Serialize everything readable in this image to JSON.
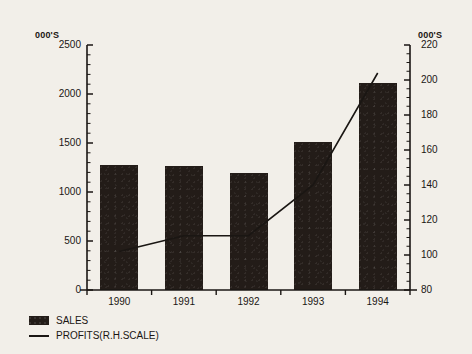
{
  "chart_data": {
    "type": "bar",
    "title": "",
    "subtitle": "",
    "xlabel": "",
    "ylabel": "000'S",
    "y2label": "000'S",
    "categories": [
      "1990",
      "1991",
      "1992",
      "1993",
      "1994"
    ],
    "grid": false,
    "legend_position": "bottom-left",
    "ylim": [
      0,
      2500
    ],
    "y2lim": [
      80,
      220
    ],
    "yticks": [
      0,
      500,
      1000,
      1500,
      2000,
      2500
    ],
    "ytick_labels": [
      "0",
      "500",
      "1000",
      "1500",
      "2000",
      "2500"
    ],
    "y2ticks": [
      80,
      100,
      120,
      140,
      160,
      180,
      200,
      220
    ],
    "y2tick_labels": [
      "80",
      "100",
      "120",
      "140",
      "160",
      "180",
      "200",
      "220"
    ],
    "y_minor_interval": 100,
    "y2_minor_interval": 5,
    "series": [
      {
        "name": "SALES",
        "type": "bar",
        "axis": "left",
        "color": "#231c18",
        "values": [
          1280,
          1265,
          1195,
          1510,
          2115
        ]
      },
      {
        "name": "PROFITS(R.H.SCALE)",
        "type": "line",
        "axis": "right",
        "color": "#1a1613",
        "values": [
          102,
          111,
          111,
          140,
          204
        ]
      }
    ]
  },
  "axes": {
    "left_unit": "000'S",
    "right_unit": "000'S"
  },
  "legend": {
    "items": [
      {
        "label": "SALES",
        "marker": "filled-swatch"
      },
      {
        "label": "PROFITS(R.H.SCALE)",
        "marker": "line"
      }
    ]
  }
}
